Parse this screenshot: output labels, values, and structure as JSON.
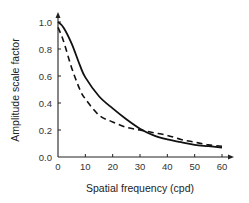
{
  "chart_data": {
    "type": "line",
    "title": "",
    "xlabel": "Spatial frequency (cpd)",
    "ylabel": "Amplitude scale factor",
    "xlim": [
      0,
      60
    ],
    "ylim": [
      0.0,
      1.0
    ],
    "xticks": [
      "0",
      "10",
      "20",
      "30",
      "40",
      "50",
      "60"
    ],
    "yticks": [
      "0.0",
      "0.2",
      "0.4",
      "0.6",
      "0.8",
      "1.0"
    ],
    "grid": false,
    "legend": null,
    "x": [
      0,
      2,
      5,
      8,
      10,
      15,
      20,
      25,
      30,
      35,
      40,
      45,
      50,
      55,
      60
    ],
    "series": [
      {
        "name": "solid",
        "style": "solid",
        "color": "#111111",
        "values": [
          1.0,
          0.96,
          0.84,
          0.68,
          0.59,
          0.45,
          0.36,
          0.28,
          0.21,
          0.16,
          0.13,
          0.11,
          0.09,
          0.08,
          0.07
        ]
      },
      {
        "name": "dashed",
        "style": "dashed",
        "color": "#111111",
        "values": [
          0.96,
          0.86,
          0.66,
          0.5,
          0.43,
          0.31,
          0.26,
          0.22,
          0.2,
          0.18,
          0.16,
          0.13,
          0.11,
          0.09,
          0.08
        ]
      }
    ]
  }
}
